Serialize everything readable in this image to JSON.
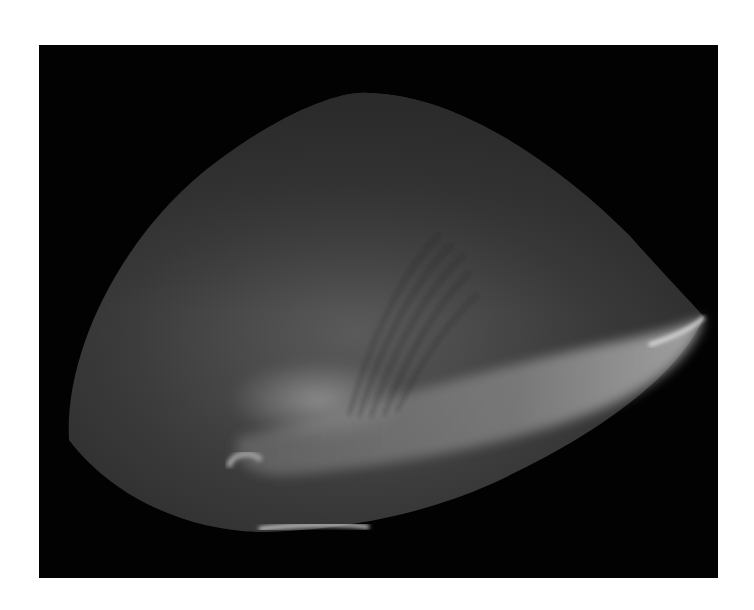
{
  "image": {
    "description": "Grayscale photograph of a translucent, lens-shaped object on a black background",
    "background_color": "#ffffff",
    "frame_color": "#020202",
    "object_base_color": "#3a3a3a",
    "highlight_color": "#b8b8b8"
  }
}
